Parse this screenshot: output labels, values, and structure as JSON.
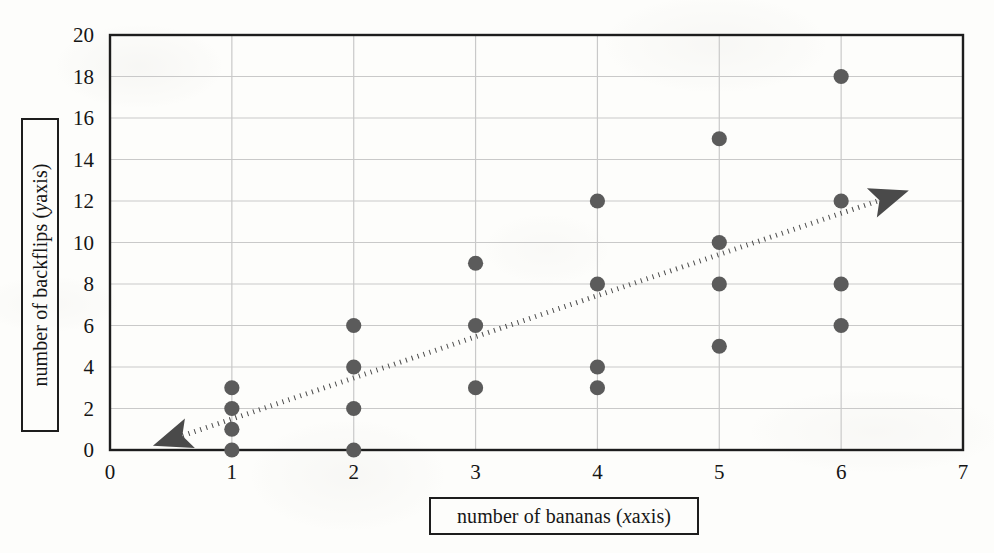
{
  "figure": {
    "background_color": "#fdfdfb",
    "axis_line_color": "#1d1d1d",
    "grid_color": "#c9c9c9",
    "marker_color": "#5b5b5b",
    "trendline_color": "#4a4a4a"
  },
  "axes": {
    "x_title_prefix": "number of bananas (",
    "x_title_italic": "x",
    "x_title_suffix": " axis)",
    "y_title_prefix": "number of backflips (",
    "y_title_italic": "y",
    "y_title_suffix": " axis)",
    "x_ticks": [
      "0",
      "1",
      "2",
      "3",
      "4",
      "5",
      "6",
      "7"
    ],
    "y_ticks": [
      "0",
      "2",
      "4",
      "6",
      "8",
      "10",
      "12",
      "14",
      "16",
      "18",
      "20"
    ]
  },
  "chart_data": {
    "type": "scatter",
    "title": "",
    "xlabel": "number of bananas (x axis)",
    "ylabel": "number of backflips (y axis)",
    "xlim": [
      0,
      7
    ],
    "ylim": [
      0,
      20
    ],
    "xticks": [
      0,
      1,
      2,
      3,
      4,
      5,
      6,
      7
    ],
    "yticks": [
      0,
      2,
      4,
      6,
      8,
      10,
      12,
      14,
      16,
      18,
      20
    ],
    "grid": true,
    "legend": null,
    "marker": "circle",
    "marker_color": "#5b5b5b",
    "points": [
      {
        "x": 1,
        "y": 0
      },
      {
        "x": 1,
        "y": 1
      },
      {
        "x": 1,
        "y": 2
      },
      {
        "x": 1,
        "y": 3
      },
      {
        "x": 2,
        "y": 0
      },
      {
        "x": 2,
        "y": 2
      },
      {
        "x": 2,
        "y": 4
      },
      {
        "x": 2,
        "y": 6
      },
      {
        "x": 3,
        "y": 3
      },
      {
        "x": 3,
        "y": 6
      },
      {
        "x": 3,
        "y": 9
      },
      {
        "x": 4,
        "y": 3
      },
      {
        "x": 4,
        "y": 4
      },
      {
        "x": 4,
        "y": 8
      },
      {
        "x": 4,
        "y": 12
      },
      {
        "x": 5,
        "y": 5
      },
      {
        "x": 5,
        "y": 8
      },
      {
        "x": 5,
        "y": 10
      },
      {
        "x": 5,
        "y": 15
      },
      {
        "x": 6,
        "y": 6
      },
      {
        "x": 6,
        "y": 8
      },
      {
        "x": 6,
        "y": 12
      },
      {
        "x": 6,
        "y": 18
      }
    ],
    "annotations": [
      {
        "type": "trend-line",
        "style": "dotted",
        "arrows": "both",
        "from": {
          "x": 0.5,
          "y": 0.5
        },
        "to": {
          "x": 6.4,
          "y": 12.2
        }
      }
    ]
  }
}
